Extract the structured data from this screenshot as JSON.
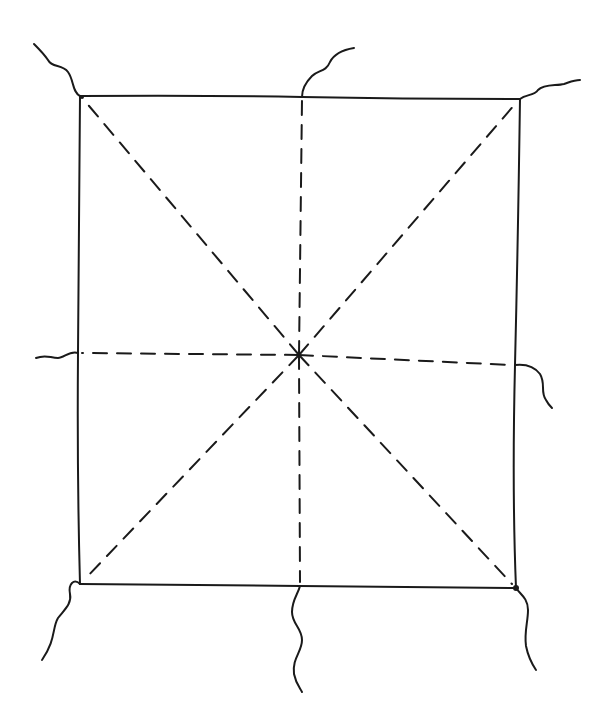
{
  "diagram": {
    "type": "hand-drawn sketch",
    "colors": {
      "ink": "#1a1a1a",
      "background": "#ffffff"
    },
    "rectangle": {
      "x1": 80,
      "y1": 96,
      "x2": 520,
      "y2": 588
    },
    "center": {
      "x": 299,
      "y": 355
    },
    "anchors": [
      {
        "id": "top-left",
        "x": 80,
        "y": 96
      },
      {
        "id": "top-mid",
        "x": 302,
        "y": 97
      },
      {
        "id": "top-right",
        "x": 520,
        "y": 99
      },
      {
        "id": "mid-left",
        "x": 78,
        "y": 353
      },
      {
        "id": "mid-right",
        "x": 515,
        "y": 365
      },
      {
        "id": "bottom-left",
        "x": 80,
        "y": 584
      },
      {
        "id": "bottom-mid",
        "x": 300,
        "y": 586
      },
      {
        "id": "bottom-right",
        "x": 516,
        "y": 588
      }
    ]
  }
}
